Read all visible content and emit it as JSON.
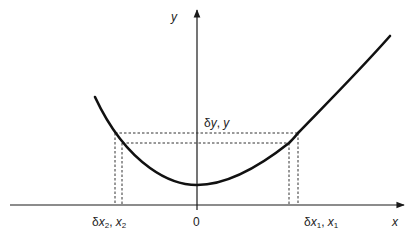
{
  "diagram": {
    "type": "function-curve-with-projections",
    "axes": {
      "x_label": "x",
      "y_label": "y",
      "origin_label": "0"
    },
    "labels": {
      "dy_y": {
        "delta": "δ",
        "var": "y",
        "sep": ", ",
        "var2": "y"
      },
      "dx2_x2": {
        "delta": "δ",
        "var": "x",
        "sub": "2",
        "sep": ", ",
        "var2": "x",
        "sub2": "2"
      },
      "dx1_x1": {
        "delta": "δ",
        "var": "x",
        "sub": "1",
        "sep": ", ",
        "var2": "x",
        "sub2": "1"
      }
    },
    "curve": {
      "description": "asymmetric U-shaped curve with minimum near the y-axis",
      "color": "#111111"
    },
    "projections": {
      "left": [
        "x2",
        "x2 + δx2"
      ],
      "right": [
        "x1",
        "x1 + δx1"
      ],
      "horizontal": [
        "y",
        "y + δy"
      ],
      "style": "dotted"
    }
  }
}
